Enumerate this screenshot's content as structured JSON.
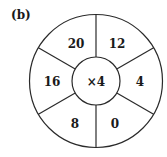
{
  "label": "(b)",
  "center": "×4",
  "segments": [
    {
      "position": "top-right",
      "value": "12"
    },
    {
      "position": "right",
      "value": "4"
    },
    {
      "position": "bottom-right",
      "value": "0"
    },
    {
      "position": "bottom-left",
      "value": "8"
    },
    {
      "position": "left",
      "value": "16"
    },
    {
      "position": "top-left",
      "value": "20"
    }
  ],
  "colors": {
    "stroke": "#2a2a2a",
    "text": "#1a1a1a",
    "background": "#ffffff"
  }
}
